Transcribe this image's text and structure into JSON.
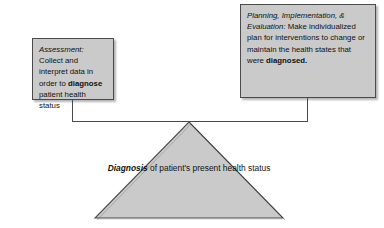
{
  "diagram": {
    "type": "process-flow",
    "background_color": "#ffffff",
    "shape_fill_color": "#c9cac9",
    "shape_border_color": "#4a4a4a",
    "text_color": "#111111",
    "boxes": [
      {
        "id": "assessment",
        "label": "Assessment:",
        "body_before": " Collect and interpret data in order to ",
        "emphasis": "diagnose",
        "body_after": " patient health status",
        "full_text": "Assessment: Collect and interpret data in order to diagnose patient health status"
      },
      {
        "id": "planning-implementation-evaluation",
        "label": "Planning, Implementation, & Evaluation:",
        "body_before": " Make individualized plan for interventions to change or maintain the health states that were ",
        "emphasis": "diagnosed.",
        "body_after": "",
        "full_text": "Planning, Implementation, & Evaluation: Make individualized plan for interventions to change or maintain the health states that were diagnosed."
      }
    ],
    "triangle": {
      "id": "diagnosis",
      "emphasis": "Diagnosis",
      "body": " of patient's present health status",
      "full_text": "Diagnosis of patient's present health status"
    }
  }
}
